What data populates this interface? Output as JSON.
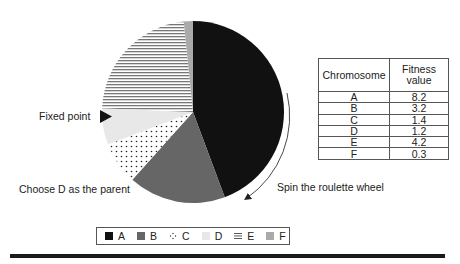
{
  "diagram": {
    "pie": {
      "center": [
        193,
        112
      ],
      "radius": 91,
      "start_angle_deg": 0,
      "direction": "clockwise",
      "slices": [
        {
          "label": "A",
          "value": 8.2,
          "fill": "#111111",
          "pattern": "solid"
        },
        {
          "label": "B",
          "value": 3.2,
          "fill": "#666666",
          "pattern": "solid"
        },
        {
          "label": "C",
          "value": 1.4,
          "fill": "#ffffff",
          "pattern": "dots"
        },
        {
          "label": "D",
          "value": 1.2,
          "fill": "#e8e8e8",
          "pattern": "solid"
        },
        {
          "label": "E",
          "value": 4.2,
          "fill": "#ffffff",
          "pattern": "horizontal-lines"
        },
        {
          "label": "F",
          "value": 0.3,
          "fill": "#aaaaaa",
          "pattern": "solid"
        }
      ]
    },
    "annotations": {
      "fixed_point": "Fixed point",
      "choose_parent": "Choose D as the parent",
      "spin": "Spin the roulette wheel"
    },
    "table": {
      "headers": [
        "Chromosome",
        "Fitness value"
      ],
      "header_line1": "Fitness",
      "header_line2": "value",
      "rows": [
        {
          "chromosome": "A",
          "fitness": "8.2"
        },
        {
          "chromosome": "B",
          "fitness": "3.2"
        },
        {
          "chromosome": "C",
          "fitness": "1.4"
        },
        {
          "chromosome": "D",
          "fitness": "1.2"
        },
        {
          "chromosome": "E",
          "fitness": "4.2"
        },
        {
          "chromosome": "F",
          "fitness": "0.3"
        }
      ]
    },
    "legend": [
      {
        "label": "A",
        "swatch": "solid-black"
      },
      {
        "label": "B",
        "swatch": "solid-dark-gray"
      },
      {
        "label": "C",
        "swatch": "dots"
      },
      {
        "label": "D",
        "swatch": "solid-light-gray"
      },
      {
        "label": "E",
        "swatch": "horizontal-lines"
      },
      {
        "label": "F",
        "swatch": "solid-mid-gray"
      }
    ]
  }
}
